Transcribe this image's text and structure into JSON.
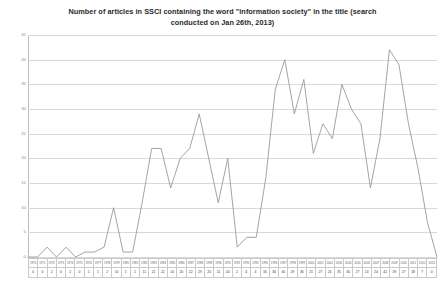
{
  "chart_data": {
    "type": "line",
    "title": "Number of articles in SSCI containing the word \"information society\" in the title (search conducted on Jan 26th, 2013)",
    "title_line1": "Number of articles in SSCI containing the word \"information society\" in the title (search",
    "title_line2": "conducted on Jan 26th, 2013)",
    "xlabel": "",
    "ylabel": "",
    "ylim": [
      0,
      45
    ],
    "ytick_step": 5,
    "yticks": [
      0,
      5,
      10,
      15,
      20,
      25,
      30,
      35,
      40,
      45
    ],
    "ytick_labels": [
      "0",
      "5",
      "10",
      "15",
      "20",
      "25",
      "30",
      "35",
      "40",
      "45"
    ],
    "grid": true,
    "legend": false,
    "legend_position": "none",
    "line_color": "#9a9a9a",
    "grid_color": "#d9d9d9",
    "categories": [
      "1970",
      "1971",
      "1972",
      "1973",
      "1974",
      "1975",
      "1976",
      "1977",
      "1978",
      "1979",
      "1980",
      "1981",
      "1982",
      "1983",
      "1984",
      "1985",
      "1986",
      "1987",
      "1988",
      "1989",
      "1990",
      "1991",
      "1992",
      "1993",
      "1994",
      "1995",
      "1996",
      "1997",
      "1998",
      "1999",
      "2000",
      "2001",
      "2002",
      "2003",
      "2004",
      "2005",
      "2006",
      "2007",
      "2008",
      "2009",
      "2010",
      "2011",
      "2012",
      "2013"
    ],
    "values": [
      0,
      0,
      2,
      0,
      2,
      0,
      1,
      1,
      2,
      10,
      1,
      1,
      11,
      22,
      22,
      14,
      20,
      22,
      29,
      20,
      11,
      20,
      2,
      4,
      4,
      16,
      34,
      40,
      29,
      36,
      21,
      27,
      24,
      35,
      30,
      27,
      14,
      24,
      42,
      39,
      27,
      18,
      7,
      0
    ],
    "table_row_labels": [
      "year",
      "count"
    ],
    "n_points": 44
  }
}
